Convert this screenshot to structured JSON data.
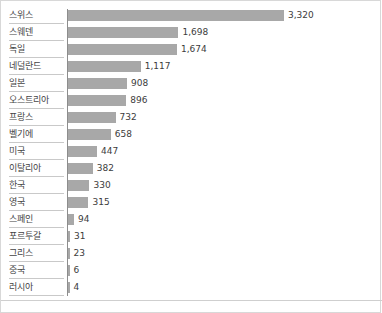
{
  "chart_data": {
    "type": "bar",
    "orientation": "horizontal",
    "title": "",
    "xlabel": "",
    "ylabel": "",
    "grid": false,
    "legend": null,
    "xlim": [
      0,
      3320
    ],
    "bar_color": "#a8a8a8",
    "axis_color": "#8d8d8d",
    "label_color": "#444444",
    "value_color": "#3c3c3c",
    "categories": [
      "스위스",
      "스웨덴",
      "독일",
      "네덜란드",
      "일본",
      "오스트리아",
      "프랑스",
      "벨기에",
      "미국",
      "이탈리아",
      "한국",
      "영국",
      "스페인",
      "포르투갈",
      "그리스",
      "중국",
      "러시아"
    ],
    "values": [
      3320,
      1698,
      1674,
      1117,
      908,
      896,
      732,
      658,
      447,
      382,
      330,
      315,
      94,
      31,
      23,
      6,
      4
    ],
    "value_labels": [
      "3,320",
      "1,698",
      "1,674",
      "1,117",
      "908",
      "896",
      "732",
      "658",
      "447",
      "382",
      "330",
      "315",
      "94",
      "31",
      "23",
      "6",
      "4"
    ]
  }
}
